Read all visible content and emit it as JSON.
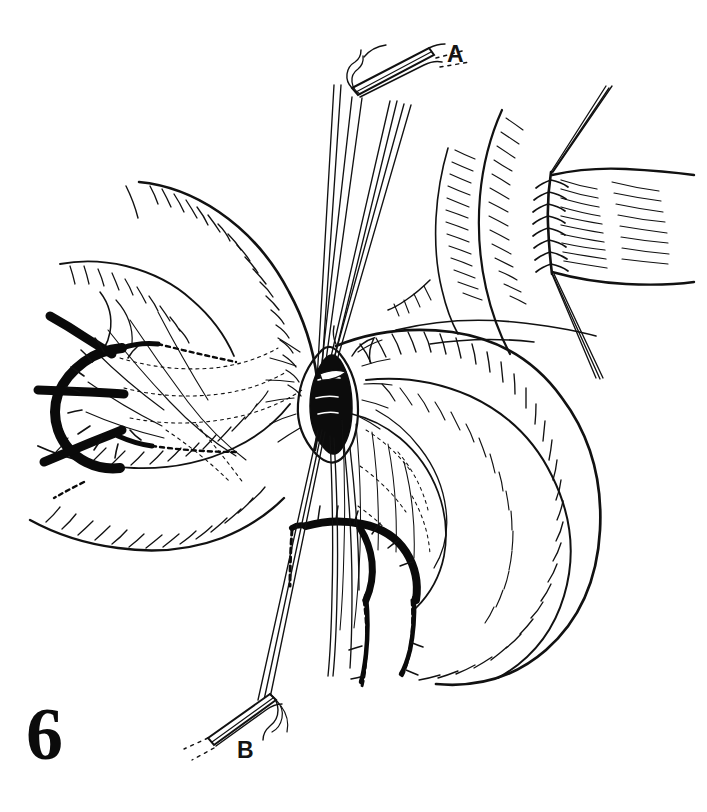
{
  "figure": {
    "number": "6",
    "domain_kind": "medical line illustration",
    "title_visible": false,
    "background_color": "#ffffff",
    "ink_color": "#0d0d0d",
    "width": 707,
    "height": 812
  },
  "labels": [
    {
      "id": "a",
      "text": "A",
      "x": 447,
      "y": 43,
      "refers_to": "needle-holder-clamp-top"
    },
    {
      "id": "b",
      "text": "B",
      "x": 237,
      "y": 739,
      "refers_to": "needle-holder-clamp-bottom"
    }
  ],
  "scene": {
    "subject": "end-to-end intestinal anastomosis with traction sutures",
    "parts": [
      {
        "name": "left-bowel-limb",
        "description": "left intestinal loop with hatched serosal shading"
      },
      {
        "name": "right-bowel-limb",
        "description": "right intestinal loop curving down and right"
      },
      {
        "name": "central-lumen",
        "description": "dark open lumen at the anastomotic site"
      },
      {
        "name": "left-mesenteric-arcade",
        "description": "dark branching mesenteric vessel arcade at left"
      },
      {
        "name": "lower-mesenteric-arcade",
        "description": "dark branching vessel arcade in lower mesentery"
      },
      {
        "name": "traction-sutures-upper",
        "description": "suture strands running up to clamp A"
      },
      {
        "name": "traction-sutures-lower",
        "description": "suture strands running down to clamp B"
      },
      {
        "name": "inset-anastomosis",
        "description": "upper-right inset of completed interrupted suture line"
      }
    ]
  },
  "inset": {
    "name": "completed-anastomosis-inset",
    "position": "upper-right",
    "description": "bowel ends joined by a vertical row of interrupted sutures with stay sutures exiting top and bottom",
    "suture_count_visible": 9
  }
}
